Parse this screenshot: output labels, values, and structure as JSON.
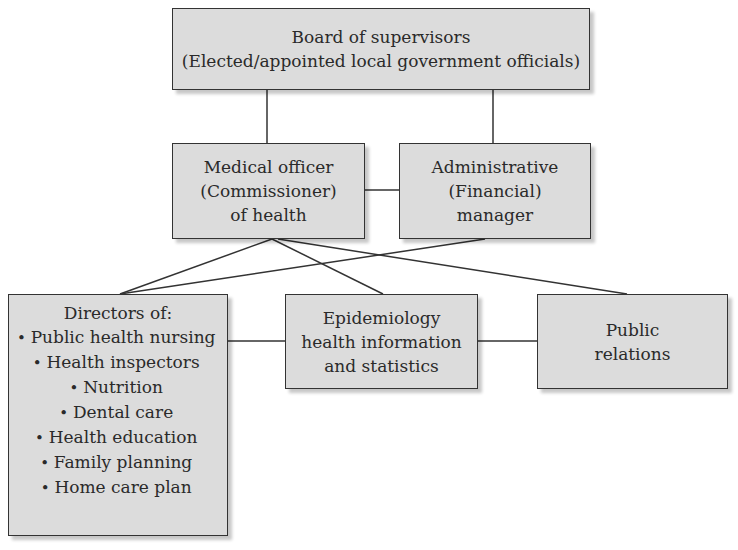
{
  "diagram": {
    "type": "org-chart",
    "nodes": {
      "board": {
        "line1": "Board of supervisors",
        "line2": "(Elected/appointed local government officials)"
      },
      "medical_officer": {
        "line1": "Medical officer",
        "line2": "(Commissioner)",
        "line3": "of health"
      },
      "admin_manager": {
        "line1": "Administrative",
        "line2": "(Financial)",
        "line3": "manager"
      },
      "directors": {
        "title": "Directors of:",
        "items": [
          "Public health nursing",
          "Health inspectors",
          "Nutrition",
          "Dental care",
          "Health education",
          "Family planning",
          "Home care plan"
        ]
      },
      "epidemiology": {
        "line1": "Epidemiology",
        "line2": "health information",
        "line3": "and statistics"
      },
      "public_relations": {
        "line1": "Public",
        "line2": "relations"
      }
    },
    "edges": [
      [
        "board",
        "medical_officer"
      ],
      [
        "board",
        "admin_manager"
      ],
      [
        "medical_officer",
        "admin_manager"
      ],
      [
        "medical_officer",
        "directors"
      ],
      [
        "medical_officer",
        "epidemiology"
      ],
      [
        "medical_officer",
        "public_relations"
      ],
      [
        "admin_manager",
        "directors"
      ],
      [
        "directors",
        "epidemiology"
      ],
      [
        "epidemiology",
        "public_relations"
      ]
    ],
    "colors": {
      "box_fill": "#dcdcdc",
      "border": "#333333",
      "line": "#333333"
    }
  }
}
